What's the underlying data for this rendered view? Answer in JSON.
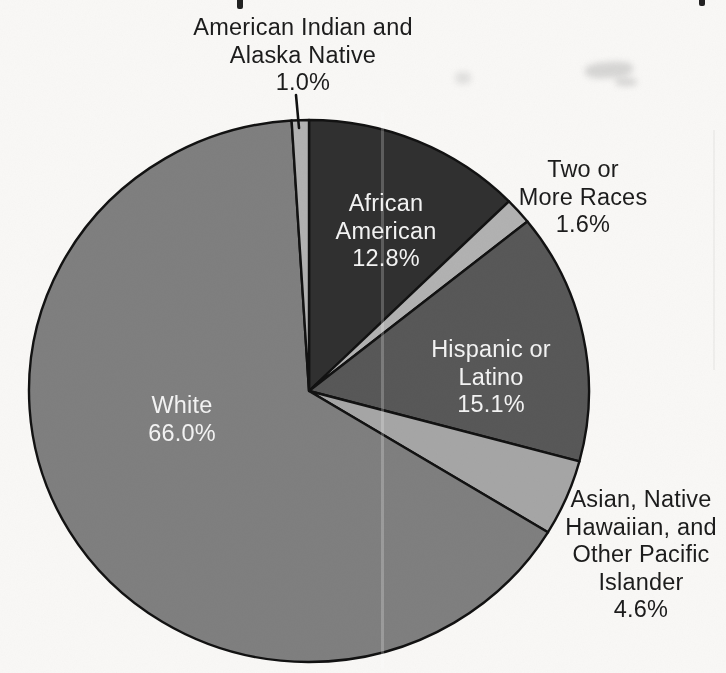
{
  "chart_data": {
    "type": "pie",
    "title": "",
    "unit": "percent",
    "start_angle_deg": 0,
    "direction": "clockwise",
    "total_shown": 101.1,
    "slices": [
      {
        "label": "African American",
        "value": 12.8,
        "display": "12.8%",
        "color": "#303030"
      },
      {
        "label": "Two or More Races",
        "value": 1.6,
        "display": "1.6%",
        "color": "#b2b2b2"
      },
      {
        "label": "Hispanic or Latino",
        "value": 15.1,
        "display": "15.1%",
        "color": "#585858"
      },
      {
        "label": "Asian, Native Hawaiian, and Other Pacific Islander",
        "value": 4.6,
        "display": "4.6%",
        "color": "#a6a6a6"
      },
      {
        "label": "White",
        "value": 66.0,
        "display": "66.0%",
        "color": "#7f7f7f"
      },
      {
        "label": "American Indian and Alaska Native",
        "value": 1.0,
        "display": "1.0%",
        "color": "#b2b2b2"
      }
    ],
    "stroke_color": "#121212",
    "legend": "none",
    "labels_placement": "mixed inside/outside with one leader line"
  },
  "labels": [
    {
      "name": "american-indian-alaska-native",
      "lines": [
        "American Indian and",
        "Alaska Native",
        "1.0%"
      ],
      "x": 303,
      "y": 14,
      "color": "#1c1c1c",
      "placement": "outside"
    },
    {
      "name": "two-or-more-races",
      "lines": [
        "Two or",
        "More Races",
        "1.6%"
      ],
      "x": 583,
      "y": 156,
      "color": "#1c1c1c",
      "placement": "outside"
    },
    {
      "name": "african-american",
      "lines": [
        "African",
        "American",
        "12.8%"
      ],
      "x": 386,
      "y": 190,
      "color": "#f2f2f2",
      "placement": "inside"
    },
    {
      "name": "hispanic-or-latino",
      "lines": [
        "Hispanic or",
        "Latino",
        "15.1%"
      ],
      "x": 491,
      "y": 336,
      "color": "#f2f2f2",
      "placement": "inside"
    },
    {
      "name": "white",
      "lines": [
        "White",
        "66.0%"
      ],
      "x": 182,
      "y": 392,
      "color": "#f2f2f2",
      "placement": "inside"
    },
    {
      "name": "asian-native-hawaiian-pacific-islander",
      "lines": [
        "Asian, Native",
        "Hawaiian, and",
        "Other Pacific",
        "Islander",
        "4.6%"
      ],
      "x": 641,
      "y": 486,
      "color": "#1c1c1c",
      "placement": "outside"
    }
  ],
  "leader_line": {
    "x1": 296,
    "y1": 95,
    "x2": 299,
    "y2": 128
  }
}
